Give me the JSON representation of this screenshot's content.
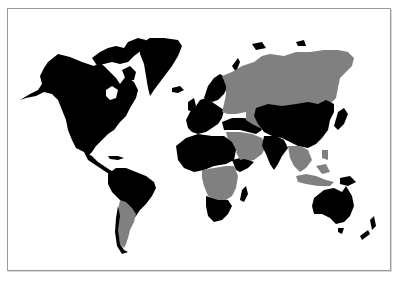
{
  "map": {
    "type": "world-choropleth",
    "projection": "miller-like",
    "background": "#ffffff",
    "frame_color": "#9a9a9a",
    "categories": [
      {
        "name": "category-a",
        "color": "#000000"
      },
      {
        "name": "category-b",
        "color": "#808080"
      }
    ],
    "regions": [
      {
        "name": "north-america",
        "category": "category-a"
      },
      {
        "name": "greenland",
        "category": "category-a"
      },
      {
        "name": "canadian-arctic-islands",
        "category": "category-a"
      },
      {
        "name": "central-america-caribbean",
        "category": "category-a"
      },
      {
        "name": "south-america-north",
        "category": "category-a"
      },
      {
        "name": "argentina",
        "category": "category-b"
      },
      {
        "name": "chile",
        "category": "category-a"
      },
      {
        "name": "europe",
        "category": "category-a"
      },
      {
        "name": "scandinavia",
        "category": "category-a"
      },
      {
        "name": "russia",
        "category": "category-b"
      },
      {
        "name": "kazakhstan-central-asia",
        "category": "category-b"
      },
      {
        "name": "china-mongolia",
        "category": "category-a"
      },
      {
        "name": "middle-east",
        "category": "category-b"
      },
      {
        "name": "turkey-iran",
        "category": "category-a"
      },
      {
        "name": "india",
        "category": "category-a"
      },
      {
        "name": "southeast-asia",
        "category": "category-b"
      },
      {
        "name": "indonesia",
        "category": "category-b"
      },
      {
        "name": "japan",
        "category": "category-a"
      },
      {
        "name": "north-africa",
        "category": "category-a"
      },
      {
        "name": "central-africa",
        "category": "category-b"
      },
      {
        "name": "east-africa",
        "category": "category-a"
      },
      {
        "name": "southern-africa",
        "category": "category-a"
      },
      {
        "name": "madagascar",
        "category": "category-a"
      },
      {
        "name": "australia",
        "category": "category-a"
      },
      {
        "name": "new-zealand",
        "category": "category-a"
      },
      {
        "name": "papua-new-guinea",
        "category": "category-a"
      }
    ]
  }
}
